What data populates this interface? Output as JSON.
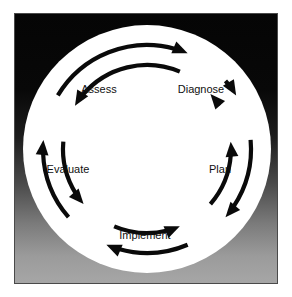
{
  "diagram": {
    "type": "cycle-diagram",
    "shape": "circle",
    "background_gradient_top": "#050505",
    "background_gradient_bottom": "#a6a6a6",
    "disc_color": "#ffffff",
    "frame_border_color": "#4a4a4a",
    "arrow_color": "#0a0a0a",
    "label_color": "#101010",
    "direction": "bidirectional",
    "stage_count": 5,
    "arrow_pair_count": 5,
    "stages": [
      {
        "id": "assess",
        "label": "Assess",
        "angle_deg": -54,
        "order": 1
      },
      {
        "id": "diagnose",
        "label": "Diagnose",
        "angle_deg": -18,
        "order": 2
      },
      {
        "id": "plan",
        "label": "Plan",
        "angle_deg": 54,
        "order": 3
      },
      {
        "id": "implement",
        "label": "Implement",
        "angle_deg": 126,
        "order": 4
      },
      {
        "id": "evaluate",
        "label": "Evaluate",
        "angle_deg": 198,
        "order": 5
      }
    ],
    "connections": [
      {
        "id": "assess-diagnose",
        "from": "Assess",
        "to": "Diagnose",
        "bidirectional": true
      },
      {
        "id": "diagnose-plan",
        "from": "Diagnose",
        "to": "Plan",
        "bidirectional": true
      },
      {
        "id": "plan-implement",
        "from": "Plan",
        "to": "Implement",
        "bidirectional": true
      },
      {
        "id": "implement-evaluate",
        "from": "Implement",
        "to": "Evaluate",
        "bidirectional": true
      },
      {
        "id": "evaluate-assess",
        "from": "Evaluate",
        "to": "Assess",
        "bidirectional": true
      }
    ]
  }
}
